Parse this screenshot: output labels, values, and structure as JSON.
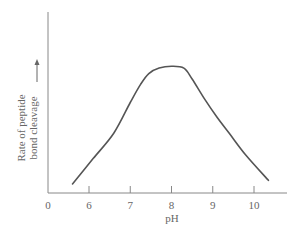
{
  "chart_data": {
    "type": "line",
    "title": "",
    "xlabel": "pH",
    "ylabel_line1": "Rate of peptide",
    "ylabel_line2": "bond cleavage",
    "ylabel_arrow": "→",
    "x_origin_label": "0",
    "xticks": [
      6,
      7,
      8,
      9,
      10
    ],
    "xtick_labels": [
      "6",
      "7",
      "8",
      "9",
      "10"
    ],
    "xlim": [
      5.0,
      10.8
    ],
    "ylim": [
      0,
      100
    ],
    "grid": false,
    "legend": null,
    "series": [
      {
        "name": "Rate of peptide bond cleavage",
        "x": [
          5.6,
          6.1,
          6.6,
          7.0,
          7.25,
          7.45,
          7.7,
          8.0,
          8.3,
          8.5,
          8.8,
          9.1,
          9.4,
          9.8,
          10.35
        ],
        "y": [
          5,
          19,
          33,
          50,
          60,
          66,
          69,
          70,
          69,
          63,
          52,
          42,
          33,
          21,
          7
        ]
      }
    ],
    "line_color": "#555555"
  }
}
